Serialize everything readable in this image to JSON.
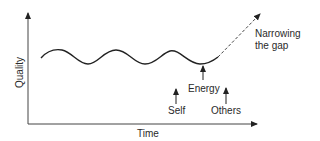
{
  "diagram": {
    "axes": {
      "x_label": "Time",
      "y_label": "Quality"
    },
    "curve": {
      "description": "oscillating quality wave"
    },
    "trend": {
      "label_line1": "Narrowing",
      "label_line2": "the gap",
      "style": "dashed arrow upward"
    },
    "arrows": [
      {
        "label": "Energy"
      },
      {
        "label": "Self"
      },
      {
        "label": "Others"
      }
    ],
    "colors": {
      "line": "#222222",
      "text": "#2a2a2a"
    }
  }
}
